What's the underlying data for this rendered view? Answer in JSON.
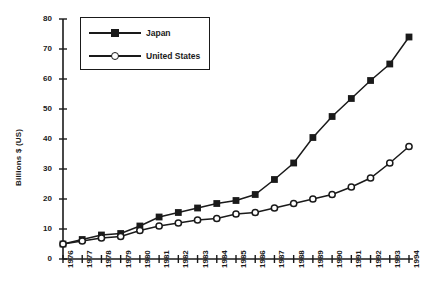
{
  "chart_data": {
    "type": "line",
    "title": "",
    "xlabel": "",
    "ylabel": "Billions $ (US)",
    "ylim": [
      0,
      80
    ],
    "yticks": [
      0,
      10,
      20,
      30,
      40,
      50,
      60,
      70,
      80
    ],
    "grid": false,
    "legend_position": "top-left",
    "categories": [
      "1976",
      "1977",
      "1978",
      "1979",
      "1980",
      "1981",
      "1982",
      "1983",
      "1984",
      "1985",
      "1986",
      "1987",
      "1988",
      "1989",
      "1990",
      "1991",
      "1992",
      "1993",
      "1994"
    ],
    "series": [
      {
        "name": "Japan",
        "marker": "filled-square",
        "color": "#1a1a1a",
        "values": [
          5,
          6.5,
          8,
          8.5,
          11,
          14,
          15.5,
          17,
          18.5,
          19.5,
          21.5,
          26.5,
          32,
          40.5,
          47.5,
          53.5,
          59.5,
          65,
          74
        ]
      },
      {
        "name": "United States",
        "marker": "open-circle",
        "color": "#1a1a1a",
        "values": [
          5,
          6,
          7,
          7.5,
          9.5,
          11,
          12,
          13,
          13.5,
          15,
          15.5,
          17,
          18.5,
          20,
          21.5,
          24,
          27,
          32,
          37.5
        ]
      }
    ],
    "last_us_value": 46
  },
  "legend": {
    "items": [
      {
        "label": "Japan"
      },
      {
        "label": "United States"
      }
    ]
  },
  "axes": {
    "y_title": "Billions $ (US)"
  }
}
